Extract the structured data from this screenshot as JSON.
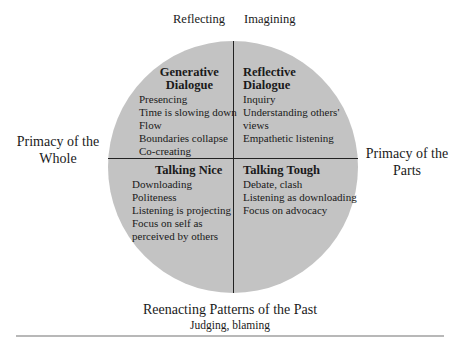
{
  "top_labels": {
    "left": "Reflecting",
    "right": "Imagining"
  },
  "side_labels": {
    "left": [
      "Primacy of the",
      "Whole"
    ],
    "right": [
      "Primacy of the",
      "Parts"
    ]
  },
  "quadrants": {
    "top_left": {
      "title": [
        "Generative",
        "Dialogue"
      ],
      "items": [
        "Presencing",
        "Time is slowing down",
        "Flow",
        "Boundaries collapse",
        "Co-creating"
      ]
    },
    "top_right": {
      "title": [
        "Reflective",
        "Dialogue"
      ],
      "items": [
        "Inquiry",
        "Understanding others'",
        "views",
        "Empathetic listening"
      ]
    },
    "bottom_left": {
      "title": [
        "Talking Nice"
      ],
      "items": [
        "Downloading",
        "Politeness",
        "Listening is projecting",
        "Focus on self as",
        "perceived by others"
      ]
    },
    "bottom_right": {
      "title": [
        "Talking Tough"
      ],
      "items": [
        "Debate, clash",
        "Listening as downloading",
        "Focus on advocacy"
      ]
    }
  },
  "bottom": {
    "title": "Reenacting Patterns of the Past",
    "subtitle": "Judging, blaming"
  },
  "colors": {
    "circle_fill": "#c3c3c3",
    "lines": "#222222"
  }
}
